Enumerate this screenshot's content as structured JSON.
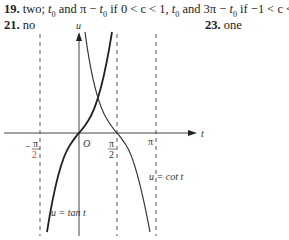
{
  "answers": {
    "a19": {
      "number": "19.",
      "text_prefix": "two; ",
      "t0_1": "t",
      "sub0_1": "0",
      "and1": " and ",
      "expr1": "π − ",
      "t0_2": "t",
      "sub0_2": "0",
      "cond1": " if 0 < c < 1, ",
      "t0_3": "t",
      "sub0_3": "0",
      "and2": " and 3π − ",
      "t0_4": "t",
      "sub0_4": "0",
      "cond2": " if −1 < c < 0"
    },
    "a21": {
      "number": "21.",
      "text": "no"
    },
    "a23": {
      "number": "23.",
      "text": "one"
    }
  },
  "graph": {
    "axis_u_label": "u",
    "axis_t_label": "t",
    "origin_label": "O",
    "tick_labels": {
      "neg_half_pi_num": "π",
      "neg_half_pi_den": "2",
      "neg_sign": "−",
      "half_pi_num": "π",
      "half_pi_den": "2",
      "pi": "π"
    },
    "curve_labels": {
      "tan": "u = tan t",
      "cot": "u = cot t"
    }
  }
}
